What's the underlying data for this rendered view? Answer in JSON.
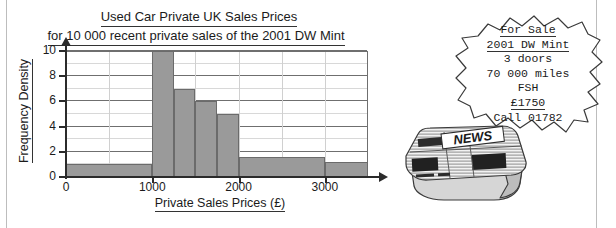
{
  "chart_data": {
    "type": "bar",
    "title": "Used Car Private UK Sales Prices for 10 000 recent private sales of the 2001 DW Mint",
    "title_line1": "Used Car Private UK Sales Prices",
    "title_line2": "for 10 000 recent private sales of the 2001 DW Mint",
    "xlabel": "Private Sales Prices (£)",
    "ylabel": "Frequency Density",
    "xlim": [
      0,
      3500
    ],
    "ylim": [
      0,
      10
    ],
    "xticks": [
      "0",
      "1000",
      "2000",
      "3000"
    ],
    "xtick_values": [
      0,
      1000,
      2000,
      3000
    ],
    "yticks": [
      "0",
      "2",
      "4",
      "6",
      "8",
      "10"
    ],
    "ytick_values": [
      0,
      2,
      4,
      6,
      8,
      10
    ],
    "grid": true,
    "grid_x_step": 500,
    "grid_y_step": 1,
    "legend": "none",
    "bar_color": "#9a9a9a",
    "bar_edge_color": "#6b6b6b",
    "bins": [
      {
        "start": 0,
        "end": 1000,
        "frequency_density": 1.0
      },
      {
        "start": 1000,
        "end": 1250,
        "frequency_density": 10.0
      },
      {
        "start": 1250,
        "end": 1500,
        "frequency_density": 7.0
      },
      {
        "start": 1500,
        "end": 1750,
        "frequency_density": 6.0
      },
      {
        "start": 1750,
        "end": 2000,
        "frequency_density": 5.0
      },
      {
        "start": 2000,
        "end": 3000,
        "frequency_density": 1.6
      },
      {
        "start": 3000,
        "end": 3500,
        "frequency_density": 1.2
      }
    ]
  },
  "ad": {
    "lines": [
      {
        "text": "For Sale",
        "underline": true
      },
      {
        "text": "2001 DW Mint",
        "underline": true
      },
      {
        "text": "3 doors",
        "underline": false
      },
      {
        "text": "70 000 miles",
        "underline": false
      },
      {
        "text": "FSH",
        "underline": false
      },
      {
        "text": "£1750",
        "underline": true
      },
      {
        "text": "Call 01782",
        "underline": false
      }
    ]
  },
  "newspaper": {
    "masthead": "NEWS"
  }
}
